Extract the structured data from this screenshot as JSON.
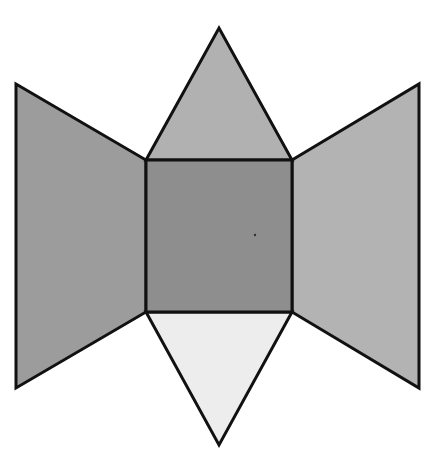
{
  "diagram": {
    "type": "net",
    "canvas": {
      "width": 434,
      "height": 469,
      "background": "#ffffff"
    },
    "stroke": {
      "color": "#111111",
      "width": 3
    },
    "faces": [
      {
        "id": "left-trapezoid",
        "shape": "trapezoid",
        "points": "16,84 146,160 146,312 16,388",
        "fill": "#9c9c9c"
      },
      {
        "id": "right-trapezoid",
        "shape": "trapezoid",
        "points": "292,160 419,84 419,388 292,312",
        "fill": "#b3b3b3"
      },
      {
        "id": "top-triangle",
        "shape": "triangle",
        "points": "146,160 219,28 292,160",
        "fill": "#b1b1b1"
      },
      {
        "id": "bottom-triangle",
        "shape": "triangle",
        "points": "146,312 292,312 219,445",
        "fill": "#ededed"
      },
      {
        "id": "center-square",
        "shape": "square",
        "points": "146,160 292,160 292,312 146,312",
        "fill": "#8e8e8e"
      }
    ],
    "marks": [
      {
        "id": "center-dot",
        "cx": 255,
        "cy": 235,
        "r": 1.2,
        "fill": "#333333"
      }
    ]
  }
}
